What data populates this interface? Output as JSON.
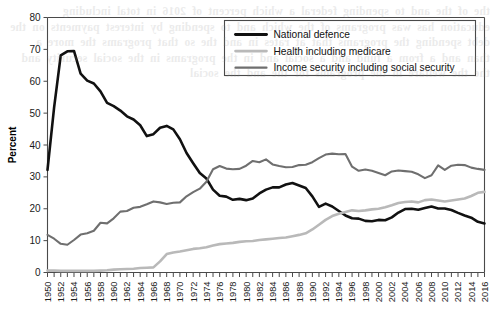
{
  "chart_data": {
    "type": "line",
    "title": "",
    "xlabel": "",
    "ylabel": "Percent",
    "xlim": [
      1950,
      2016
    ],
    "ylim": [
      0,
      80
    ],
    "ytick_step": 10,
    "xtick_label_step": 2,
    "grid": false,
    "legend_position": "top-right",
    "yticks": [
      0,
      10,
      20,
      30,
      40,
      50,
      60,
      70,
      80
    ],
    "x": [
      1950,
      1951,
      1952,
      1953,
      1954,
      1955,
      1956,
      1957,
      1958,
      1959,
      1960,
      1961,
      1962,
      1963,
      1964,
      1965,
      1966,
      1967,
      1968,
      1969,
      1970,
      1971,
      1972,
      1973,
      1974,
      1975,
      1976,
      1977,
      1978,
      1979,
      1980,
      1981,
      1982,
      1983,
      1984,
      1985,
      1986,
      1987,
      1988,
      1989,
      1990,
      1991,
      1992,
      1993,
      1994,
      1995,
      1996,
      1997,
      1998,
      1999,
      2000,
      2001,
      2002,
      2003,
      2004,
      2005,
      2006,
      2007,
      2008,
      2009,
      2010,
      2011,
      2012,
      2013,
      2014,
      2015,
      2016
    ],
    "xtick_labels": [
      "1950",
      "1952",
      "1954",
      "1956",
      "1958",
      "1960",
      "1962",
      "1964",
      "1966",
      "1968",
      "1970",
      "1972",
      "1974",
      "1976",
      "1978",
      "1980",
      "1982",
      "1984",
      "1986",
      "1988",
      "1990",
      "1992",
      "1994",
      "1996",
      "1998",
      "2000",
      "2002",
      "2004",
      "2006",
      "2008",
      "2010",
      "2012",
      "2014",
      "2016"
    ],
    "series": [
      {
        "name": "National defence",
        "color": "#111111",
        "width": 2.6,
        "values": [
          32.2,
          51.8,
          68.1,
          69.4,
          69.5,
          62.4,
          60.2,
          59.3,
          56.8,
          53.2,
          52.2,
          50.8,
          49.0,
          48.0,
          46.2,
          42.8,
          43.4,
          45.4,
          46.0,
          44.9,
          41.8,
          37.5,
          34.3,
          31.2,
          29.5,
          26.0,
          24.1,
          23.8,
          22.8,
          23.1,
          22.7,
          23.2,
          24.8,
          26.0,
          26.7,
          26.7,
          27.6,
          28.1,
          27.3,
          26.5,
          23.9,
          20.6,
          21.6,
          20.7,
          19.3,
          17.9,
          17.0,
          16.9,
          16.2,
          16.1,
          16.5,
          16.4,
          17.3,
          18.8,
          19.9,
          20.0,
          19.7,
          20.2,
          20.7,
          20.1,
          20.1,
          19.6,
          18.7,
          17.9,
          17.2,
          15.9,
          15.4
        ]
      },
      {
        "name": "Health including medicare",
        "color": "#b9b9b9",
        "width": 2.6,
        "values": [
          0.6,
          0.6,
          0.5,
          0.5,
          0.5,
          0.5,
          0.5,
          0.5,
          0.6,
          0.7,
          0.9,
          1.0,
          1.1,
          1.2,
          1.4,
          1.5,
          1.6,
          3.5,
          5.8,
          6.3,
          6.6,
          7.0,
          7.4,
          7.6,
          7.9,
          8.5,
          8.9,
          9.1,
          9.3,
          9.6,
          9.8,
          9.9,
          10.2,
          10.4,
          10.6,
          10.8,
          11.0,
          11.4,
          11.8,
          12.3,
          13.5,
          15.0,
          16.5,
          17.7,
          18.4,
          19.0,
          19.5,
          19.3,
          19.5,
          19.8,
          20.0,
          20.5,
          21.1,
          21.8,
          22.1,
          22.3,
          22.0,
          22.7,
          22.9,
          22.6,
          22.3,
          22.6,
          22.9,
          23.2,
          24.0,
          25.0,
          25.3
        ]
      },
      {
        "name": "Income security including social security",
        "color": "#6f6f6f",
        "width": 2.1,
        "values": [
          11.8,
          10.6,
          9.0,
          8.7,
          10.2,
          11.9,
          12.3,
          13.1,
          15.6,
          15.4,
          17.0,
          19.1,
          19.3,
          20.3,
          20.6,
          21.4,
          22.3,
          22.0,
          21.5,
          21.9,
          22.0,
          23.9,
          25.2,
          26.3,
          28.5,
          32.4,
          33.4,
          32.6,
          32.4,
          32.5,
          33.5,
          35.0,
          34.6,
          35.5,
          33.9,
          33.4,
          33.0,
          33.1,
          33.7,
          33.8,
          34.6,
          35.9,
          37.0,
          37.3,
          37.1,
          37.2,
          33.2,
          31.9,
          32.3,
          31.9,
          31.2,
          30.5,
          31.7,
          32.0,
          31.8,
          31.6,
          30.8,
          29.6,
          30.5,
          33.6,
          32.2,
          33.5,
          33.8,
          33.7,
          32.9,
          32.5,
          32.2
        ]
      }
    ]
  },
  "legend": {
    "items": [
      {
        "label": "National defence"
      },
      {
        "label": "Health including medicare"
      },
      {
        "label": "Income security including social security"
      }
    ]
  },
  "axes": {
    "y_title": "Percent"
  },
  "bleed_through": "the of the and to spending federal a which percent of 2016 in total including education has was programs of the which and to spending by interest payments on the debt spending the programs that at rates in and the so that programs the more a than and a from a fund and a social and in the programs in the social security and the the welfare in the programs for the and the social"
}
